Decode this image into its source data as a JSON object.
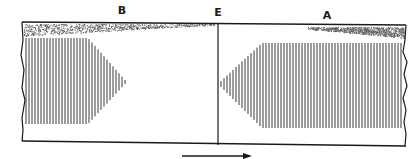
{
  "diagram": {
    "labels": {
      "left_region": "B",
      "boundary": "E",
      "right_region": "A"
    },
    "colors": {
      "ink": "#1a1a1a",
      "hatch": "#3a3a3a",
      "stipple": "#5a5a5a",
      "background": "#ffffff"
    },
    "regions": [
      {
        "id": "B",
        "stipple": "band along top, full at left edge, tapering toward boundary E",
        "hatching": "vertical lines, full at left edge, tapering to a point facing E"
      },
      {
        "id": "A",
        "stipple": "band along top, full at right edge, tapering toward boundary E",
        "hatching": "vertical lines, full at right edge, tapering to a point facing E"
      }
    ],
    "arrow": {
      "direction": "right",
      "meaning": "direction of travel / flow"
    }
  }
}
